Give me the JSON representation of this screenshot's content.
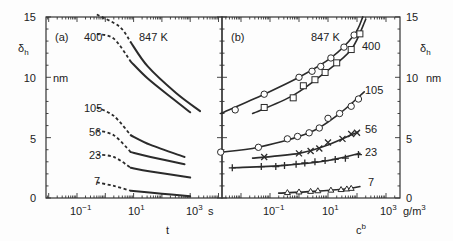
{
  "chart_data": [
    {
      "panel": "(a)",
      "type": "line",
      "xlabel": "t",
      "xunit": "s",
      "ylabel": "δh",
      "yunit": "nm",
      "xscale": "log",
      "xticks": [
        "10^-1",
        "10^1",
        "10^3"
      ],
      "xlim_log10": [
        -2.1,
        4.1
      ],
      "yticks": [
        0,
        5,
        10,
        15
      ],
      "ylim": [
        0,
        15
      ],
      "series": [
        {
          "name": "847 K",
          "dashed_log10t": [
            [
              -0.3,
              15.2
            ],
            [
              0.5,
              14.2
            ],
            [
              0.9,
              12.9
            ]
          ],
          "solid_log10t": [
            [
              0.9,
              12.9
            ],
            [
              1.5,
              10.9
            ],
            [
              2.5,
              8.7
            ],
            [
              3.35,
              7.2
            ]
          ]
        },
        {
          "name": "400",
          "dashed_log10t": [
            [
              -0.3,
              13.6
            ],
            [
              0.3,
              13.2
            ],
            [
              0.9,
              11.3
            ]
          ],
          "solid_log10t": [
            [
              0.9,
              11.3
            ],
            [
              1.5,
              9.9
            ],
            [
              2.4,
              8.2
            ],
            [
              3.0,
              7.1
            ]
          ]
        },
        {
          "name": "105",
          "dashed_log10t": [
            [
              -0.3,
              7.5
            ],
            [
              0.3,
              6.8
            ],
            [
              0.9,
              5.2
            ]
          ],
          "solid_log10t": [
            [
              0.9,
              5.2
            ],
            [
              1.6,
              4.4
            ],
            [
              2.8,
              3.4
            ]
          ]
        },
        {
          "name": "56",
          "dashed_log10t": [
            [
              -0.3,
              5.6
            ],
            [
              0.3,
              5.2
            ],
            [
              0.9,
              3.8
            ]
          ],
          "solid_log10t": [
            [
              0.9,
              3.8
            ],
            [
              1.6,
              3.4
            ],
            [
              2.8,
              2.8
            ]
          ]
        },
        {
          "name": "23",
          "dashed_log10t": [
            [
              -0.3,
              3.6
            ],
            [
              0.3,
              3.4
            ],
            [
              0.9,
              2.5
            ]
          ],
          "solid_log10t": [
            [
              0.9,
              2.5
            ],
            [
              1.6,
              2.2
            ],
            [
              3.0,
              1.7
            ]
          ]
        },
        {
          "name": "7",
          "dashed_log10t": [
            [
              -0.3,
              1.3
            ],
            [
              0.3,
              1.0
            ],
            [
              0.9,
              0.6
            ]
          ],
          "solid_log10t": [
            [
              0.9,
              0.6
            ],
            [
              2.0,
              0.35
            ],
            [
              3.0,
              0.15
            ]
          ]
        }
      ]
    },
    {
      "panel": "(b)",
      "type": "scatter",
      "xlabel": "c^b",
      "xunit": "g/m^3",
      "ylabel": "δh",
      "yunit": "nm",
      "xscale": "log",
      "xticks": [
        "10^-1",
        "10^1",
        "10^3"
      ],
      "xlim_log10": [
        -2.7,
        3.4
      ],
      "yticks": [
        0,
        5,
        10,
        15
      ],
      "ylim": [
        0,
        15
      ],
      "series": [
        {
          "name": "847 K",
          "marker": "circle",
          "points_log10c": [
            [
              -2.2,
              7.3
            ],
            [
              -1.2,
              8.6
            ],
            [
              0.0,
              10.0
            ],
            [
              0.45,
              10.5
            ],
            [
              0.75,
              10.9
            ],
            [
              1.1,
              11.6
            ],
            [
              1.55,
              12.5
            ],
            [
              1.9,
              13.5
            ]
          ],
          "curve_log10c": [
            [
              -2.7,
              7.0
            ],
            [
              -1.2,
              8.6
            ],
            [
              0.0,
              10.0
            ],
            [
              1.1,
              11.6
            ],
            [
              1.9,
              13.5
            ],
            [
              2.2,
              15.0
            ]
          ]
        },
        {
          "name": "400",
          "marker": "square",
          "points_log10c": [
            [
              -1.2,
              7.5
            ],
            [
              -0.2,
              8.3
            ],
            [
              0.15,
              9.3
            ],
            [
              0.55,
              9.8
            ],
            [
              0.9,
              10.4
            ],
            [
              1.3,
              11.2
            ],
            [
              1.8,
              12.3
            ],
            [
              2.1,
              13.6
            ]
          ],
          "curve_log10c": [
            [
              -1.6,
              7.0
            ],
            [
              -0.2,
              8.5
            ],
            [
              0.9,
              10.4
            ],
            [
              1.8,
              12.3
            ],
            [
              2.3,
              14.8
            ]
          ]
        },
        {
          "name": "105",
          "marker": "circle",
          "points_log10c": [
            [
              -2.7,
              3.8
            ],
            [
              -1.4,
              4.2
            ],
            [
              -0.4,
              4.9
            ],
            [
              -0.05,
              5.1
            ],
            [
              0.35,
              5.4
            ],
            [
              0.7,
              5.8
            ],
            [
              1.0,
              6.6
            ],
            [
              1.4,
              7.0
            ],
            [
              1.8,
              7.6
            ],
            [
              2.05,
              8.2
            ]
          ],
          "curve_log10c": [
            [
              -2.7,
              3.8
            ],
            [
              -1.4,
              4.2
            ],
            [
              0.35,
              5.4
            ],
            [
              1.4,
              7.0
            ],
            [
              2.25,
              8.8
            ]
          ]
        },
        {
          "name": "56",
          "marker": "x",
          "points_log10c": [
            [
              -1.2,
              3.4
            ],
            [
              0.0,
              3.7
            ],
            [
              0.4,
              3.9
            ],
            [
              0.7,
              4.1
            ],
            [
              1.0,
              4.6
            ],
            [
              1.5,
              4.9
            ],
            [
              1.8,
              5.3
            ],
            [
              2.0,
              5.4
            ]
          ],
          "curve_log10c": [
            [
              -1.6,
              3.3
            ],
            [
              0.0,
              3.7
            ],
            [
              1.0,
              4.4
            ],
            [
              2.05,
              5.5
            ]
          ]
        },
        {
          "name": "23",
          "marker": "plus",
          "points_log10c": [
            [
              -2.3,
              2.5
            ],
            [
              -1.3,
              2.6
            ],
            [
              -0.8,
              2.6
            ],
            [
              -0.5,
              2.7
            ],
            [
              -0.1,
              2.8
            ],
            [
              0.2,
              2.9
            ],
            [
              0.55,
              3.0
            ],
            [
              0.9,
              3.1
            ],
            [
              1.25,
              3.2
            ],
            [
              1.6,
              3.3
            ],
            [
              2.05,
              3.6
            ]
          ],
          "curve_log10c": [
            [
              -2.3,
              2.5
            ],
            [
              -0.5,
              2.7
            ],
            [
              1.0,
              3.1
            ],
            [
              2.1,
              3.7
            ]
          ]
        },
        {
          "name": "7",
          "marker": "triangle",
          "points_log10c": [
            [
              -0.4,
              0.45
            ],
            [
              0.0,
              0.5
            ],
            [
              0.4,
              0.55
            ],
            [
              0.65,
              0.6
            ],
            [
              1.1,
              0.65
            ],
            [
              1.45,
              0.7
            ],
            [
              1.65,
              0.75
            ],
            [
              1.8,
              0.8
            ]
          ],
          "curve_log10c": [
            [
              -0.7,
              0.4
            ],
            [
              0.5,
              0.55
            ],
            [
              1.6,
              0.75
            ],
            [
              2.1,
              0.95
            ]
          ]
        }
      ]
    }
  ],
  "labels": {
    "panel_a": "(a)",
    "panel_b": "(b)",
    "a_xlabel": "t",
    "a_xunit": "s",
    "b_xlabel": "c",
    "b_xlabel_sup": "b",
    "b_xunit": "g/m",
    "b_xunit_sup": "3",
    "ylabel": "δ",
    "ylabel_sub": "h",
    "yunit": "nm",
    "yticks": [
      "0",
      "5",
      "10",
      "15"
    ],
    "xtick_base": "10",
    "xtick_exps": [
      "−1",
      "1",
      "3"
    ],
    "series_a": [
      "847 K",
      "400",
      "105",
      "56",
      "23",
      "7"
    ],
    "series_b": [
      "847 K",
      "400",
      "105",
      "56",
      "23",
      "7"
    ]
  }
}
